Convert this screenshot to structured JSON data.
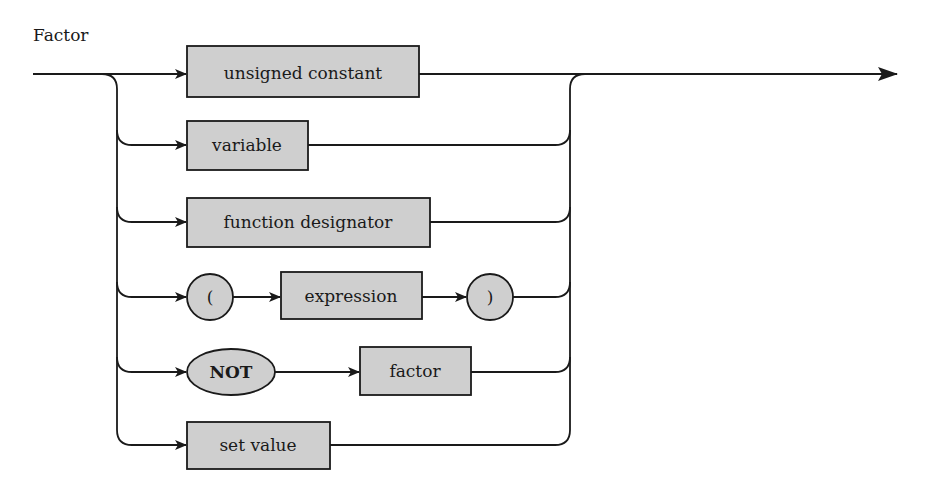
{
  "diagram": {
    "title": "Factor",
    "colors": {
      "fill": "#cfcfcf",
      "stroke": "#1a1a1a",
      "background": "#ffffff"
    },
    "alternatives": [
      {
        "kind": "nonterminal",
        "label": "unsigned constant"
      },
      {
        "kind": "nonterminal",
        "label": "variable"
      },
      {
        "kind": "nonterminal",
        "label": "function designator"
      },
      {
        "kind": "sequence",
        "items": [
          {
            "kind": "terminal",
            "label": "("
          },
          {
            "kind": "nonterminal",
            "label": "expression"
          },
          {
            "kind": "terminal",
            "label": ")"
          }
        ]
      },
      {
        "kind": "sequence",
        "items": [
          {
            "kind": "keyword",
            "label": "NOT"
          },
          {
            "kind": "nonterminal",
            "label": "factor"
          }
        ]
      },
      {
        "kind": "nonterminal",
        "label": "set value"
      }
    ]
  }
}
